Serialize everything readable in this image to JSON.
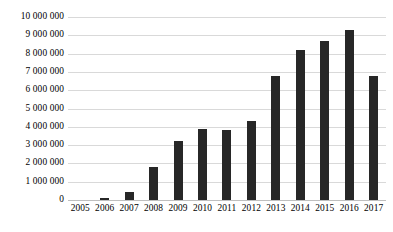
{
  "chart_data": {
    "type": "bar",
    "title": "",
    "subtitle": "",
    "xlabel": "",
    "ylabel": "",
    "categories": [
      "2005",
      "2006",
      "2007",
      "2008",
      "2009",
      "2010",
      "2011",
      "2012",
      "2013",
      "2014",
      "2015",
      "2016",
      "2017"
    ],
    "values": [
      0,
      100000,
      450000,
      1800000,
      3200000,
      3900000,
      3800000,
      4300000,
      6800000,
      8200000,
      8700000,
      9300000,
      6800000
    ],
    "ylim": [
      0,
      10000000
    ],
    "ytick_values": [
      0,
      1000000,
      2000000,
      3000000,
      4000000,
      5000000,
      6000000,
      7000000,
      8000000,
      9000000,
      10000000
    ],
    "ytick_labels": [
      "0",
      "1 000 000",
      "2 000 000",
      "3 000 000",
      "4 000 000",
      "5 000 000",
      "6 000 000",
      "7 000 000",
      "8 000 000",
      "9 000 000",
      "10 000 000"
    ],
    "grid": true,
    "grid_axis": "y",
    "legend": false,
    "legend_position": "none",
    "annotations": [],
    "colors": {
      "bar": "#272727",
      "gridline": "#d9d9d9",
      "baseline": "#bfbfbf",
      "background": "#ffffff",
      "text": "#000000"
    }
  }
}
